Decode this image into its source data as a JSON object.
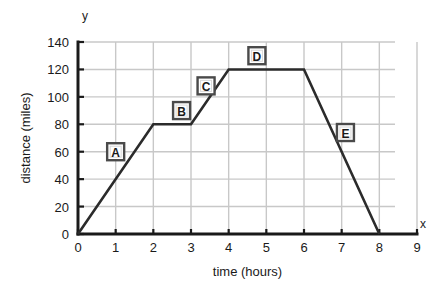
{
  "chart_data": {
    "type": "line",
    "title": "",
    "xlabel": "time (hours)",
    "ylabel": "distance (miles)",
    "x_axis_name": "x",
    "y_axis_name": "y",
    "xlim": [
      0,
      9
    ],
    "ylim": [
      0,
      140
    ],
    "x_ticks": [
      "0",
      "1",
      "2",
      "3",
      "4",
      "5",
      "6",
      "7",
      "8",
      "9"
    ],
    "y_ticks": [
      "0",
      "20",
      "40",
      "60",
      "80",
      "100",
      "120",
      "140"
    ],
    "x_tick_values": [
      0,
      1,
      2,
      3,
      4,
      5,
      6,
      7,
      8,
      9
    ],
    "y_tick_values": [
      0,
      20,
      40,
      60,
      80,
      100,
      120,
      140
    ],
    "grid": true,
    "legend": "none",
    "series": [
      {
        "name": "journey",
        "points": [
          {
            "x": 0,
            "y": 0
          },
          {
            "x": 2,
            "y": 80
          },
          {
            "x": 3,
            "y": 80
          },
          {
            "x": 4,
            "y": 120
          },
          {
            "x": 6,
            "y": 120
          },
          {
            "x": 8,
            "y": 0
          }
        ]
      }
    ],
    "annotations": [
      {
        "label": "A",
        "x": 1.0,
        "y": 60,
        "segment": "0-2h rising 0 to 80 miles"
      },
      {
        "label": "B",
        "x": 2.75,
        "y": 90,
        "segment": "2-3h flat at 80 miles"
      },
      {
        "label": "C",
        "x": 3.4,
        "y": 108,
        "segment": "3-4h rising 80 to 120 miles"
      },
      {
        "label": "D",
        "x": 4.75,
        "y": 130,
        "segment": "4-6h flat at 120 miles"
      },
      {
        "label": "E",
        "x": 7.1,
        "y": 74,
        "segment": "6-8h falling 120 to 0 miles"
      }
    ],
    "colors": {
      "grid": "#c8c8c8",
      "axis": "#1a1a1a",
      "line": "#2b2b2b",
      "background": "#ffffff"
    }
  }
}
